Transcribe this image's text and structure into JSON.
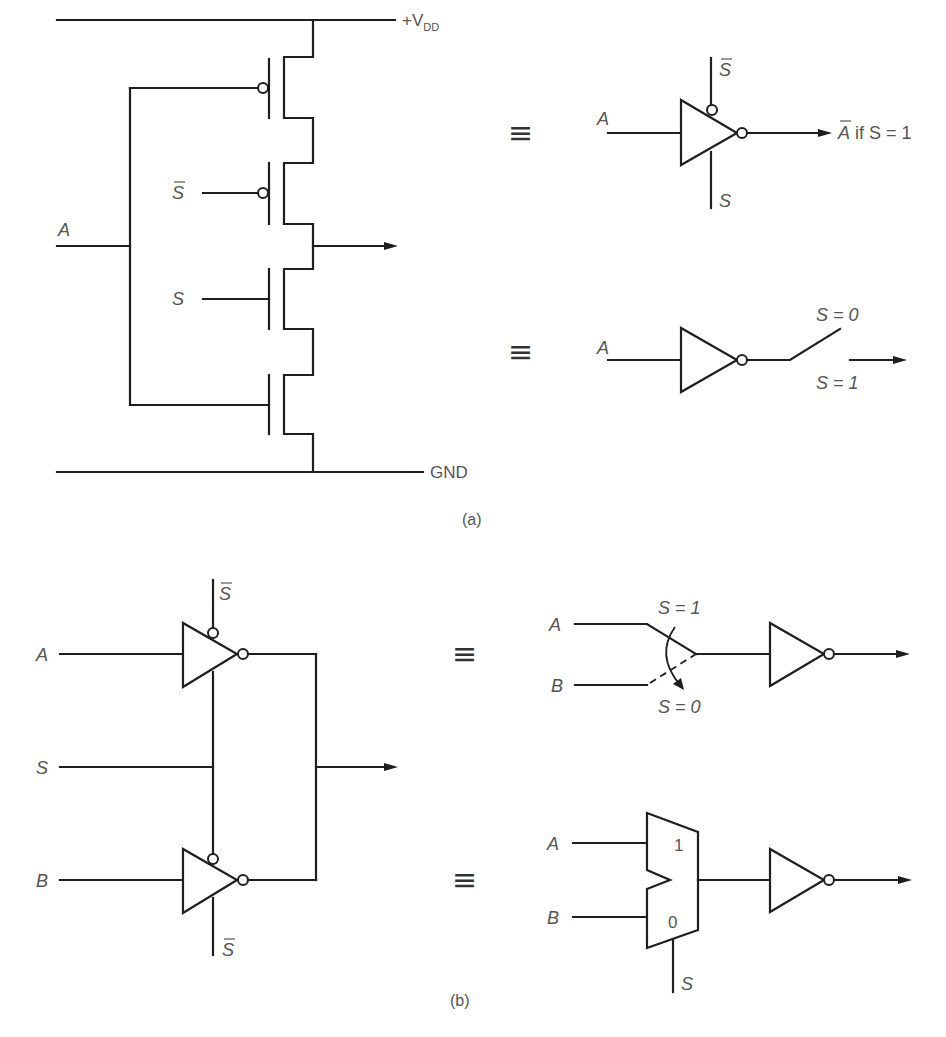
{
  "figure": {
    "part_a": {
      "caption": "(a)",
      "supply_label": "+V",
      "supply_subscript": "DD",
      "ground_label": "GND",
      "inputs": {
        "a": "A",
        "s": "S",
        "s_bar": "S"
      },
      "equivalents": [
        {
          "symbol": "≡",
          "input": "A",
          "control_top": "S",
          "control_bottom": "S",
          "output_label_bar": "A",
          "output_label_rest": " if S = 1"
        },
        {
          "symbol": "≡",
          "input": "A",
          "switch_open_label": "S = 0",
          "switch_closed_label": "S = 1"
        }
      ]
    },
    "part_b": {
      "caption": "(b)",
      "inputs": {
        "a": "A",
        "s": "S",
        "b": "B"
      },
      "control_labels": {
        "top": "S",
        "bottom": "S"
      },
      "equivalents": [
        {
          "symbol": "≡",
          "input_a": "A",
          "input_b": "B",
          "switch_top_label": "S = 1",
          "switch_bottom_label": "S = 0"
        },
        {
          "symbol": "≡",
          "input_a": "A",
          "input_b": "B",
          "mux_input_1": "1",
          "mux_input_0": "0",
          "select": "S"
        }
      ]
    }
  }
}
